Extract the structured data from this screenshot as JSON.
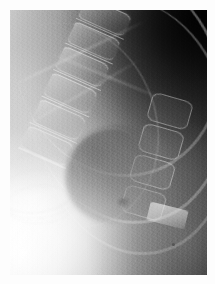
{
  "image": {
    "kind": "medical-radiograph",
    "modality": "X-ray",
    "view": "lateral thoracolumbar spine",
    "colorspace": "grayscale",
    "width_px": 215,
    "height_px": 284,
    "border": {
      "color": "#fdfdfd",
      "width_px": 10
    },
    "exposure_area": {
      "left_px": 10,
      "top_px": 10,
      "width_px": 197,
      "height_px": 265
    },
    "tones": {
      "darkest": "#0d0d0d",
      "dark": "#2f2f2f",
      "mid": "#8a8a8a",
      "light": "#d8d8d8",
      "brightest": "#ffffff"
    },
    "regions": [
      {
        "name": "upper-right-dark-field",
        "description": "deep radiolucent shadow, near black",
        "tone": "#141414"
      },
      {
        "name": "lower-left-bright-field",
        "description": "dense overexposed soft tissue, near white",
        "tone": "#fbfbfb"
      },
      {
        "name": "lower-right-mid-field",
        "description": "uniform mid gray plateau",
        "tone": "#8a8a8a"
      },
      {
        "name": "upper-left-haze",
        "description": "light gray soft tissue haze",
        "tone": "#c4c4c4"
      }
    ],
    "structures": [
      {
        "name": "rib-arc-upper",
        "type": "rib",
        "tone": "#f2f2f2"
      },
      {
        "name": "rib-arc-middle",
        "type": "rib",
        "tone": "#f2f2f2"
      },
      {
        "name": "rib-arc-lower",
        "type": "rib",
        "tone": "#e8e8e8"
      },
      {
        "name": "rib-arc-lateral",
        "type": "rib",
        "tone": "#dcdcdc"
      },
      {
        "name": "vertebral-body-1",
        "type": "vertebra",
        "tone": "#d2d2d2"
      },
      {
        "name": "vertebral-body-2",
        "type": "vertebra",
        "tone": "#d2d2d2"
      },
      {
        "name": "vertebral-body-3",
        "type": "vertebra",
        "tone": "#d6d6d6"
      },
      {
        "name": "vertebral-body-4",
        "type": "vertebra",
        "tone": "#d2d2d2"
      },
      {
        "name": "vertebral-body-5",
        "type": "vertebra",
        "tone": "#c8c8c8"
      },
      {
        "name": "vertebral-body-6",
        "type": "vertebra",
        "tone": "#c0c0c0"
      },
      {
        "name": "facet-joint-1",
        "type": "posterior-element",
        "tone": "#ededed"
      },
      {
        "name": "facet-joint-2",
        "type": "posterior-element",
        "tone": "#ededed"
      },
      {
        "name": "facet-joint-3",
        "type": "posterior-element",
        "tone": "#f0f0f0"
      },
      {
        "name": "facet-joint-4",
        "type": "posterior-element",
        "tone": "#e2e2e2"
      },
      {
        "name": "spinous-process-tip",
        "type": "posterior-element",
        "tone": "#ffffff"
      },
      {
        "name": "diaphragm-dome",
        "type": "soft-tissue-border",
        "tone": "#4a4a4a"
      },
      {
        "name": "bowel-gas-contour",
        "type": "soft-tissue-border",
        "tone": "#cecece"
      },
      {
        "name": "nodular-density",
        "type": "focal-density",
        "tone": "#5c5c5c"
      }
    ],
    "artifacts": [
      {
        "name": "vertical-scan-striation",
        "description": "fine vertical line banding from digitization"
      },
      {
        "name": "film-grain",
        "description": "quantum mottle / emulsion grain"
      }
    ],
    "annotations": [],
    "caption": ""
  }
}
